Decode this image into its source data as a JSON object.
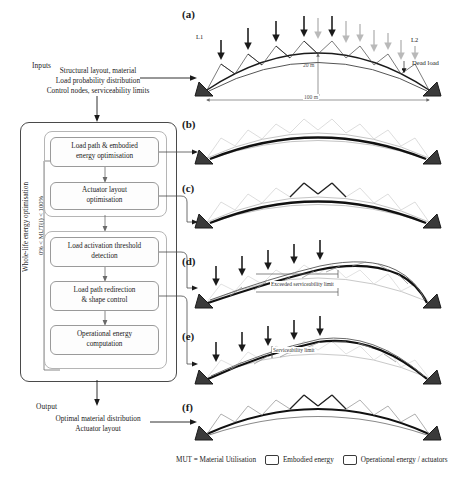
{
  "figure": {
    "panels": [
      {
        "id": "a",
        "label": "(a)"
      },
      {
        "id": "b",
        "label": "(b)"
      },
      {
        "id": "c",
        "label": "(c)"
      },
      {
        "id": "d",
        "label": "(d)"
      },
      {
        "id": "e",
        "label": "(e)"
      },
      {
        "id": "f",
        "label": "(f)"
      }
    ]
  },
  "inputs": {
    "heading": "Inputs",
    "line1": "Structural layout, material",
    "line2": "Load probability distribution",
    "line3": "Control nodes, serviceability limits"
  },
  "flow": {
    "outer_label": "Whole-life energy optimisation",
    "loop_label": "0% < MUT(i) < 100%",
    "boxes": [
      {
        "id": "load-path-embodied",
        "line1": "Load path & embodied",
        "line2": "energy optimisation"
      },
      {
        "id": "actuator-layout",
        "line1": "Actuator layout",
        "line2": "optimisation"
      },
      {
        "id": "load-activation",
        "line1": "Load activation threshold",
        "line2": "detection"
      },
      {
        "id": "load-redirection",
        "line1": "Load path redirection",
        "line2": "& shape control"
      },
      {
        "id": "operational-energy",
        "line1": "Operational energy",
        "line2": "computation"
      }
    ]
  },
  "output": {
    "heading": "Output",
    "line1": "Optimal material distribution",
    "line2": "Actuator layout"
  },
  "panel_a": {
    "letter": "(a)",
    "load_left": "L1",
    "load_right": "L2",
    "dead_load": "Dead load",
    "rise": "20 m",
    "span": "100 m"
  },
  "panel_d": {
    "letter": "(d)",
    "annotation": "Exceeded serviceability limit"
  },
  "panel_e": {
    "letter": "(e)",
    "annotation": "Serviceability limit"
  },
  "legend": {
    "mut": "MUT = Material Utilisation",
    "embodied": "Embodied energy",
    "operational": "Operational energy / actuators"
  },
  "colors": {
    "ink": "#1a1a1a",
    "ghost": "#b9b9b9",
    "mid": "#7d7d7d",
    "box_border": "#9a9a9a"
  }
}
